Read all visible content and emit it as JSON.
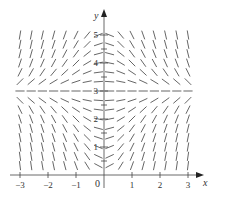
{
  "figure": {
    "type": "slope_field",
    "equation": "dy/dx = x(3 - y)",
    "ink_color": "#555555",
    "axis_color": "#444444"
  },
  "axes": {
    "x_label": "x",
    "y_label": "y",
    "origin_label": "0",
    "x_ticks": [
      {
        "value": -3,
        "label": "−3"
      },
      {
        "value": -2,
        "label": "−2"
      },
      {
        "value": -1,
        "label": "−1"
      },
      {
        "value": 1,
        "label": "1"
      },
      {
        "value": 2,
        "label": "2"
      },
      {
        "value": 3,
        "label": "3"
      }
    ],
    "y_ticks": [
      {
        "value": 1,
        "label": "1"
      },
      {
        "value": 2,
        "label": "2"
      },
      {
        "value": 3,
        "label": "3"
      },
      {
        "value": 4,
        "label": "4"
      },
      {
        "value": 5,
        "label": "5"
      }
    ],
    "x_range": [
      -3.2,
      3.4
    ],
    "y_range": [
      -0.5,
      5.7
    ]
  },
  "field": {
    "x_start": -3.0,
    "x_end": 3.0,
    "x_step": 0.4,
    "y_start": 0.3333,
    "y_end": 5.0,
    "y_step": 0.3333,
    "equilibrium_y": 3
  }
}
